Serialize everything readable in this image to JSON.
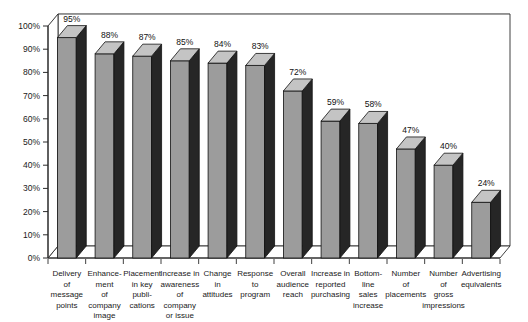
{
  "chart_data": {
    "type": "bar",
    "title": "",
    "subtitle": "",
    "xlabel": "",
    "ylabel": "",
    "ylim": [
      0,
      100
    ],
    "yticks": [
      "0%",
      "10%",
      "20%",
      "30%",
      "40%",
      "50%",
      "60%",
      "70%",
      "80%",
      "90%",
      "100%"
    ],
    "ytick_values": [
      0,
      10,
      20,
      30,
      40,
      50,
      60,
      70,
      80,
      90,
      100
    ],
    "grid": true,
    "legend": false,
    "legend_position": "none",
    "style": "3d-column",
    "categories": [
      "Delivery of message points",
      "Enhance-ment of company image",
      "Placement in key publi-cations",
      "Increase in awareness of company or issue",
      "Change in attitudes",
      "Response to program",
      "Overall audience reach",
      "Increase in reported purchasing",
      "Bottom-line sales increase",
      "Number of placements",
      "Number of gross impressions",
      "Advertising equivalents"
    ],
    "category_lines": [
      [
        "Delivery",
        "of",
        "message",
        "points"
      ],
      [
        "Enhance-",
        "ment",
        "of",
        "company",
        "image"
      ],
      [
        "Placement",
        "in key",
        "publi-",
        "cations"
      ],
      [
        "Increase in",
        "awareness",
        "of",
        "company",
        "or issue"
      ],
      [
        "Change",
        "in",
        "attitudes"
      ],
      [
        "Response",
        "to",
        "program"
      ],
      [
        "Overall",
        "audience",
        "reach"
      ],
      [
        "Increase in",
        "reported",
        "purchasing"
      ],
      [
        "Bottom-",
        "line",
        "sales",
        "increase"
      ],
      [
        "Number",
        "of",
        "placements"
      ],
      [
        "Number",
        "of",
        "gross",
        "impressions"
      ],
      [
        "Advertising",
        "equivalents"
      ]
    ],
    "values": [
      95,
      88,
      87,
      85,
      84,
      83,
      72,
      59,
      58,
      47,
      40,
      24
    ],
    "value_labels": [
      "95%",
      "88%",
      "87%",
      "85%",
      "84%",
      "83%",
      "72%",
      "59%",
      "58%",
      "47%",
      "40%",
      "24%"
    ],
    "colors": {
      "bar_front": "#9c9c9c",
      "bar_side": "#262626",
      "bar_top": "#c4c4c4",
      "bar_outline": "#111111",
      "grid": "#b9b9b9",
      "axis": "#2b2b2b",
      "plot_background": "#ffffff",
      "page_background": "#ffffff",
      "text": "#1a1a1a"
    }
  }
}
